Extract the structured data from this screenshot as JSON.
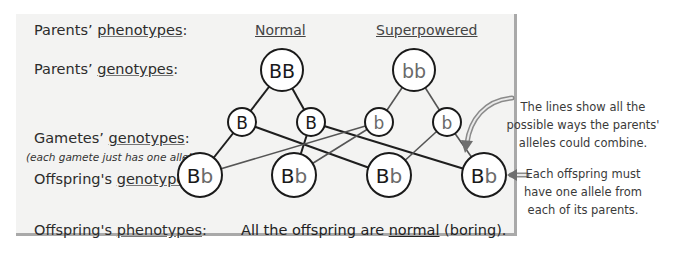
{
  "rows": {
    "parents_phenotypes": {
      "prefix": "Parents’ ",
      "term": "phenotypes",
      "suffix": ":"
    },
    "parents_genotypes": {
      "prefix": "Parents’ ",
      "term": "genotypes",
      "suffix": ":"
    },
    "gametes_genotypes": {
      "prefix": "Gametes’ ",
      "term": "genotypes",
      "suffix": ":"
    },
    "gametes_note": "(each gamete just has one allele)",
    "offspring_genotypes": {
      "prefix": "Offspring's ",
      "term": "genotypes",
      "suffix": ":"
    },
    "offspring_phenotypes": {
      "prefix": "Offspring's ",
      "term": "phenotypes",
      "suffix": ":"
    }
  },
  "columns": {
    "parent1_phenotype": "Normal",
    "parent2_phenotype": "Superpowered"
  },
  "parents": [
    {
      "genotype": "BB",
      "cx": 282,
      "cy": 70,
      "r": 21
    },
    {
      "genotype": "bb",
      "cx": 414,
      "cy": 70,
      "r": 21
    }
  ],
  "gametes": [
    {
      "allele": "B",
      "cx": 242,
      "cy": 122,
      "r": 14,
      "parent": 0
    },
    {
      "allele": "B",
      "cx": 311,
      "cy": 122,
      "r": 14,
      "parent": 0
    },
    {
      "allele": "b",
      "cx": 379,
      "cy": 122,
      "r": 14,
      "parent": 1
    },
    {
      "allele": "b",
      "cx": 447,
      "cy": 122,
      "r": 14,
      "parent": 1
    }
  ],
  "offspring": [
    {
      "genotype_dominant": "B",
      "genotype_recessive": "b",
      "cx": 200,
      "cy": 175,
      "r": 22
    },
    {
      "genotype_dominant": "B",
      "genotype_recessive": "b",
      "cx": 294,
      "cy": 175,
      "r": 22
    },
    {
      "genotype_dominant": "B",
      "genotype_recessive": "b",
      "cx": 389,
      "cy": 175,
      "r": 22
    },
    {
      "genotype_dominant": "B",
      "genotype_recessive": "b",
      "cx": 484,
      "cy": 175,
      "r": 22
    }
  ],
  "gamete_to_offspring": [
    [
      0,
      0
    ],
    [
      0,
      2
    ],
    [
      1,
      1
    ],
    [
      1,
      3
    ],
    [
      2,
      0
    ],
    [
      2,
      1
    ],
    [
      3,
      2
    ],
    [
      3,
      3
    ]
  ],
  "result": {
    "prefix": "All the offspring are ",
    "term": "normal",
    "suffix": " (boring)."
  },
  "notes": {
    "lines_note": [
      "The lines show all the",
      "possible ways the parents'",
      "alleles could combine."
    ],
    "offspring_note": [
      "Each offspring must",
      "have one allele from",
      "each of its parents."
    ]
  },
  "colors": {
    "panel_bg": "#f3f3f2",
    "panel_border": "#a9a9a9",
    "dominant_line": "#1e1e1e",
    "recessive_line": "#555555",
    "recessive_text": "#6a6a6a",
    "arrow": "#777777"
  }
}
